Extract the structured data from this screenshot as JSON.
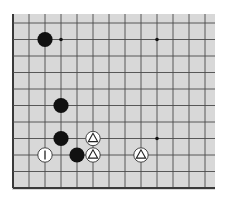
{
  "board": {
    "name": "go-board-diagram",
    "background": "#d8d8d8",
    "line_color": "#4a4a4a",
    "edge_color": "#3a3a3a",
    "origin_x": 13,
    "origin_y": 23,
    "spacing_x": 16,
    "spacing_y": 16.5,
    "columns": 13,
    "rows": 11,
    "left_edge": true,
    "bottom_edge": true,
    "rect": {
      "x": 12,
      "y": 14,
      "w": 203,
      "h": 176
    }
  },
  "star_points": [
    {
      "col": 3,
      "row": 1
    },
    {
      "col": 9,
      "row": 1
    },
    {
      "col": 9,
      "row": 7
    }
  ],
  "stones": [
    {
      "color": "black",
      "col": 2,
      "row": 1,
      "marker": null
    },
    {
      "color": "black",
      "col": 3,
      "row": 5,
      "marker": null
    },
    {
      "color": "black",
      "col": 3,
      "row": 7,
      "marker": null
    },
    {
      "color": "black",
      "col": 4,
      "row": 8,
      "marker": null
    },
    {
      "color": "white",
      "col": 2,
      "row": 8,
      "marker": "label",
      "label": "1"
    },
    {
      "color": "white",
      "col": 5,
      "row": 7,
      "marker": "triangle"
    },
    {
      "color": "white",
      "col": 5,
      "row": 8,
      "marker": "triangle"
    },
    {
      "color": "white",
      "col": 8,
      "row": 8,
      "marker": "triangle"
    }
  ],
  "colors": {
    "black_stone": "#111111",
    "white_stone": "#ffffff",
    "white_stone_outline": "#333333",
    "marker": "#222222"
  }
}
